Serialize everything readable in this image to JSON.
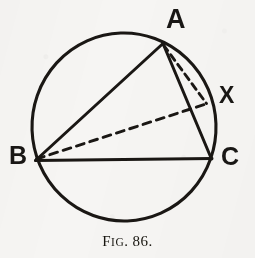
{
  "figure": {
    "caption": {
      "lead": "F",
      "smallcaps": "IG",
      "period_after_prefix": ".",
      "number": "86.",
      "full_text": "FIG. 86."
    },
    "colors": {
      "ink": "#1a1714",
      "paper": "#f6f5f3"
    },
    "labels": [
      {
        "id": "A",
        "text": "A"
      },
      {
        "id": "X",
        "text": "X"
      },
      {
        "id": "B",
        "text": "B"
      },
      {
        "id": "C",
        "text": "C"
      }
    ],
    "geometry": {
      "circle": {
        "cx": 124,
        "cy": 127,
        "r": 93
      },
      "points": {
        "A": {
          "x": 163,
          "y": 42
        },
        "B": {
          "x": 35,
          "y": 160
        },
        "C": {
          "x": 211,
          "y": 159
        },
        "X": {
          "x": 207,
          "y": 104
        }
      },
      "segments": [
        {
          "name": "BA",
          "from": "B",
          "to": "A",
          "style": "solid"
        },
        {
          "name": "AC",
          "from": "A",
          "to": "C",
          "style": "solid"
        },
        {
          "name": "BC",
          "from": "B",
          "to": "C",
          "style": "solid"
        },
        {
          "name": "AX",
          "from": "A",
          "to": "X",
          "style": "dashed"
        },
        {
          "name": "BX",
          "from": "B",
          "to": "X",
          "style": "dashed"
        }
      ]
    }
  }
}
